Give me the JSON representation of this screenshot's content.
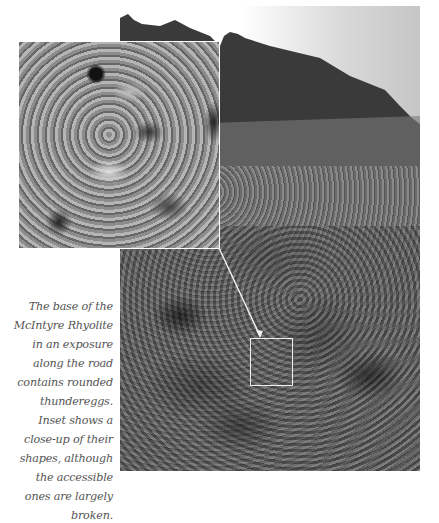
{
  "figure": {
    "main_photo_alt": "Rock exposure of the base of the McIntyre Rhyolite along a road",
    "inset_alt": "Close-up of rounded thunderegg shapes",
    "colors": {
      "caption_text": "#555555",
      "inset_border": "#ffffff",
      "connector_line": "#ffffff"
    }
  },
  "caption": {
    "lines": [
      "The base of the",
      "McIntyre Rhyolite",
      "in an exposure",
      "along the road",
      "contains rounded",
      "thundereggs.",
      "Inset shows a",
      "close-up of their",
      "shapes, although",
      "the accessible",
      "ones are largely",
      "broken."
    ]
  }
}
